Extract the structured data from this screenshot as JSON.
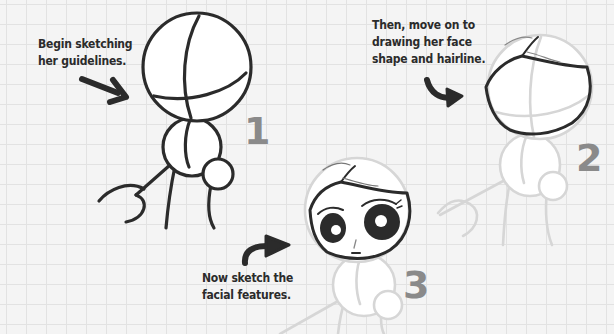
{
  "steps": [
    {
      "number": "1",
      "caption_lines": [
        "Begin sketching",
        "her guidelines."
      ]
    },
    {
      "number": "2",
      "caption_lines": [
        "Then, move on to",
        "drawing her face",
        "shape and hairline."
      ]
    },
    {
      "number": "3",
      "caption_lines": [
        "Now sketch the",
        "facial features."
      ]
    }
  ],
  "colors": {
    "ink": "#2b2b2b",
    "guideline_faint": "#d4d4d4",
    "step_number": "#8a8a8a",
    "paper": "#f4f4f4",
    "grid": "#e2e2e2"
  }
}
